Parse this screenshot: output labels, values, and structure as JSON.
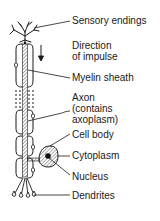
{
  "diagram": {
    "type": "neuron-anatomy",
    "colors": {
      "ink": "#1a1a1a",
      "background": "#ffffff",
      "hatch": "#555555"
    },
    "direction_arrow": "down-arrow",
    "labels": {
      "sensory_endings": "Sensory endings",
      "direction_line1": "Direction",
      "direction_line2": "of impulse",
      "myelin_sheath": "Myelin sheath",
      "axon_line1": "Axon",
      "axon_line2": "(contains",
      "axon_line3": "axoplasm)",
      "cell_body": "Cell body",
      "cytoplasm": "Cytoplasm",
      "nucleus": "Nucleus",
      "dendrites": "Dendrites"
    }
  }
}
